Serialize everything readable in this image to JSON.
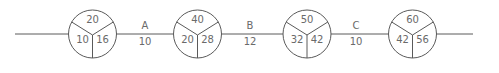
{
  "diagram": {
    "type": "activity-on-arrow network",
    "line": {
      "x1": 15,
      "x2": 473,
      "y": 34
    },
    "nodes": [
      {
        "id": "node-1",
        "cx": 92.5,
        "top": "20",
        "left": "10",
        "right": "16"
      },
      {
        "id": "node-2",
        "cx": 197.5,
        "top": "40",
        "left": "20",
        "right": "28"
      },
      {
        "id": "node-3",
        "cx": 307,
        "top": "50",
        "left": "32",
        "right": "42"
      },
      {
        "id": "node-4",
        "cx": 412.5,
        "top": "60",
        "left": "42",
        "right": "56"
      }
    ],
    "edges": [
      {
        "label": "A",
        "duration": "10",
        "x": 145
      },
      {
        "label": "B",
        "duration": "12",
        "x": 250
      },
      {
        "label": "C",
        "duration": "10",
        "x": 356
      }
    ],
    "colors": {
      "stroke": "#5a5a5a",
      "text": "#6a6a6a",
      "background": "#ffffff"
    }
  }
}
